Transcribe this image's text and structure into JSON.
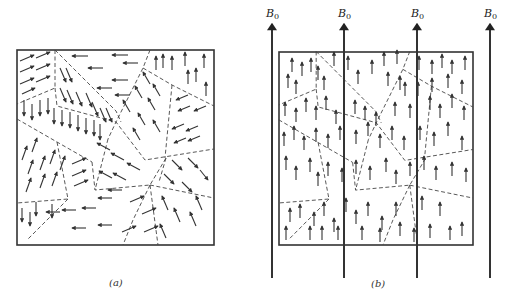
{
  "figure": {
    "panel_a": {
      "caption": "(a)",
      "description": "Unmagnetized ferromagnet: randomly oriented magnetic domains separated by dashed domain walls"
    },
    "panel_b": {
      "caption": "(b)",
      "description": "Magnetized ferromagnet in external field B0: domain moments aligned upward",
      "field_label_main": "B",
      "field_label_sub": "0",
      "field_line_count": 4
    },
    "colors": {
      "ink": "#333333",
      "background": "#ffffff"
    }
  }
}
